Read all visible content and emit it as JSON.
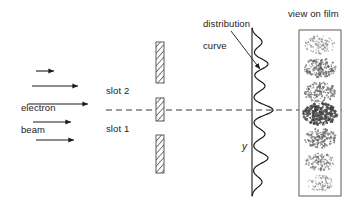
{
  "figure": {
    "background_color": "#ffffff",
    "line_color": "#1b1b1b"
  },
  "labels": {
    "electron_beam_line1": "electron",
    "electron_beam_line2": "beam",
    "slot_2": "slot 2",
    "slot_1": "slot 1",
    "distribution_curve_line1": "distribution",
    "distribution_curve_line2": "curve",
    "view_on_film": "view on film",
    "y_axis": "y"
  },
  "beam": {
    "arrow_count": 5,
    "arrows": [
      {
        "x1": 36,
        "y1": 71,
        "x2": 56,
        "y2": 71
      },
      {
        "x1": 32,
        "y1": 86,
        "x2": 80,
        "y2": 86
      },
      {
        "x1": 28,
        "y1": 104,
        "x2": 90,
        "y2": 104
      },
      {
        "x1": 33,
        "y1": 122,
        "x2": 73,
        "y2": 122
      },
      {
        "x1": 36,
        "y1": 140,
        "x2": 76,
        "y2": 140
      }
    ]
  },
  "barrier": {
    "x": 156,
    "width": 8,
    "segments": [
      {
        "y": 42,
        "height": 41
      },
      {
        "y": 98,
        "height": 23
      },
      {
        "y": 135,
        "height": 38
      }
    ],
    "slots": [
      {
        "name": "slot 2",
        "y_center": 90
      },
      {
        "name": "slot 1",
        "y_center": 128
      }
    ],
    "hatch_color": "#6a6a6a"
  },
  "axis": {
    "x": 252,
    "y_top": 28,
    "y_bottom": 196,
    "centerline_y": 110,
    "centerline_x1": 0,
    "centerline_x2": 357,
    "style": "dashed"
  },
  "chart_data": {
    "type": "line",
    "title": "distribution curve",
    "xlabel": "intensity",
    "ylabel": "y",
    "orientation": "vertical-axis",
    "grid": false,
    "legend": false,
    "axis_range_y": [
      28,
      196
    ],
    "peak_count": 7,
    "peaks": [
      {
        "y": 42,
        "amplitude": 10,
        "order": 3
      },
      {
        "y": 64,
        "amplitude": 16,
        "order": 2
      },
      {
        "y": 86,
        "amplitude": 13,
        "order": 1
      },
      {
        "y": 110,
        "amplitude": 21,
        "order": 0
      },
      {
        "y": 134,
        "amplitude": 13,
        "order": -1
      },
      {
        "y": 158,
        "amplitude": 16,
        "order": -2
      },
      {
        "y": 182,
        "amplitude": 10,
        "order": -3
      }
    ]
  },
  "film": {
    "x": 299,
    "y": 30,
    "width": 42,
    "height": 166,
    "border_color": "#6a6a6a",
    "band_count": 7,
    "bands": [
      {
        "y_center": 45,
        "radius_x": 15,
        "radius_y": 9,
        "density": 0.42,
        "dots": 120
      },
      {
        "y_center": 68,
        "radius_x": 16,
        "radius_y": 10,
        "density": 0.62,
        "dots": 190
      },
      {
        "y_center": 92,
        "radius_x": 16,
        "radius_y": 10,
        "density": 0.58,
        "dots": 175
      },
      {
        "y_center": 114,
        "radius_x": 17,
        "radius_y": 11,
        "density": 0.9,
        "dots": 290
      },
      {
        "y_center": 138,
        "radius_x": 16,
        "radius_y": 10,
        "density": 0.6,
        "dots": 180
      },
      {
        "y_center": 162,
        "radius_x": 15,
        "radius_y": 9,
        "density": 0.5,
        "dots": 145
      },
      {
        "y_center": 183,
        "radius_x": 13,
        "radius_y": 8,
        "density": 0.38,
        "dots": 100
      }
    ]
  },
  "pointer": {
    "name": "distribution-curve-leader-line",
    "x1": 231,
    "y1": 31,
    "x2": 262,
    "y2": 70
  },
  "label_positions": {
    "electron_beam": {
      "x": 10,
      "y": 92
    },
    "slot_2": {
      "x": 106,
      "y": 90
    },
    "slot_1": {
      "x": 106,
      "y": 128
    },
    "distribution_curve": {
      "x": 192,
      "y": 8
    },
    "view_on_film": {
      "x": 288,
      "y": 9
    },
    "y_axis": {
      "x": 242,
      "y": 142
    }
  }
}
